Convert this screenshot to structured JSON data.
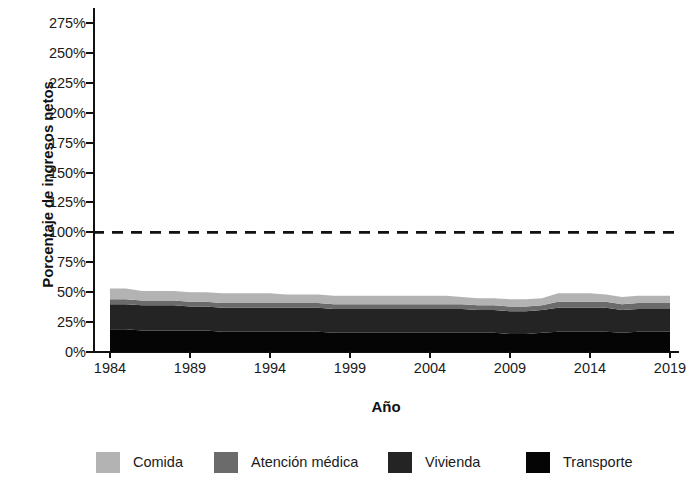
{
  "axes": {
    "ylabel": "Porcentaje de ingresos netos",
    "xlabel": "Año",
    "yticks": [
      "0%",
      "25%",
      "50%",
      "75%",
      "100%",
      "125%",
      "150%",
      "175%",
      "200%",
      "225%",
      "250%",
      "275%"
    ],
    "xticks": [
      "1984",
      "1989",
      "1994",
      "1999",
      "2004",
      "2009",
      "2014",
      "2019"
    ]
  },
  "legend": {
    "items": [
      {
        "label": "Comida",
        "color": "#b3b3b3"
      },
      {
        "label": "Atención médica",
        "color": "#6b6b6b"
      },
      {
        "label": "Vivienda",
        "color": "#242424"
      },
      {
        "label": "Transporte",
        "color": "#050505"
      }
    ]
  },
  "reference_line": {
    "value": 100,
    "label": "100%",
    "style": "dashed",
    "color": "#111111"
  },
  "chart_data": {
    "type": "area",
    "title": "",
    "xlabel": "Año",
    "ylabel": "Porcentaje de ingresos netos",
    "xlim": [
      1984,
      2019
    ],
    "ylim": [
      0,
      287.5
    ],
    "ytick_values": [
      0,
      25,
      50,
      75,
      100,
      125,
      150,
      175,
      200,
      225,
      250,
      275
    ],
    "xtick_values": [
      1984,
      1989,
      1994,
      1999,
      2004,
      2009,
      2014,
      2019
    ],
    "grid": false,
    "legend_position": "bottom",
    "stacked": true,
    "stack_order_bottom_to_top": [
      "Transporte",
      "Vivienda",
      "Atención médica",
      "Comida"
    ],
    "x": [
      1984,
      1985,
      1986,
      1987,
      1988,
      1989,
      1990,
      1991,
      1992,
      1993,
      1994,
      1995,
      1996,
      1997,
      1998,
      1999,
      2000,
      2001,
      2002,
      2003,
      2004,
      2005,
      2006,
      2007,
      2008,
      2009,
      2010,
      2011,
      2012,
      2013,
      2014,
      2015,
      2016,
      2017,
      2018,
      2019
    ],
    "series": [
      {
        "name": "Transporte",
        "color": "#050505",
        "values": [
          19,
          19,
          18,
          18,
          18,
          18,
          18,
          17,
          17,
          17,
          17,
          17,
          17,
          17,
          16,
          16,
          16,
          16,
          16,
          16,
          16,
          16,
          16,
          16,
          16,
          15,
          15,
          16,
          17,
          17,
          17,
          17,
          16,
          17,
          17,
          17
        ]
      },
      {
        "name": "Vivienda",
        "color": "#242424",
        "values": [
          21,
          21,
          21,
          21,
          21,
          20,
          20,
          20,
          20,
          20,
          20,
          20,
          20,
          20,
          20,
          20,
          20,
          20,
          20,
          20,
          20,
          20,
          20,
          19,
          19,
          19,
          19,
          19,
          20,
          20,
          20,
          20,
          19,
          19,
          19,
          19
        ]
      },
      {
        "name": "Atención médica",
        "color": "#6b6b6b",
        "values": [
          4,
          4,
          4,
          4,
          4,
          4,
          4,
          4,
          4,
          4,
          4,
          4,
          4,
          4,
          4,
          4,
          4,
          4,
          4,
          4,
          4,
          4,
          4,
          4,
          4,
          4,
          4,
          4,
          5,
          5,
          5,
          5,
          5,
          5,
          5,
          5
        ]
      },
      {
        "name": "Comida",
        "color": "#b3b3b3",
        "values": [
          9,
          9,
          8,
          8,
          8,
          8,
          8,
          8,
          8,
          8,
          8,
          7,
          7,
          7,
          7,
          7,
          7,
          7,
          7,
          7,
          7,
          7,
          6,
          6,
          6,
          6,
          6,
          6,
          7,
          7,
          7,
          6,
          6,
          6,
          6,
          6
        ]
      }
    ],
    "totals": [
      53,
      53,
      51,
      51,
      51,
      50,
      50,
      49,
      49,
      49,
      49,
      48,
      48,
      48,
      47,
      47,
      47,
      47,
      47,
      47,
      47,
      47,
      46,
      45,
      45,
      44,
      44,
      45,
      49,
      49,
      49,
      48,
      46,
      47,
      47,
      47
    ]
  }
}
